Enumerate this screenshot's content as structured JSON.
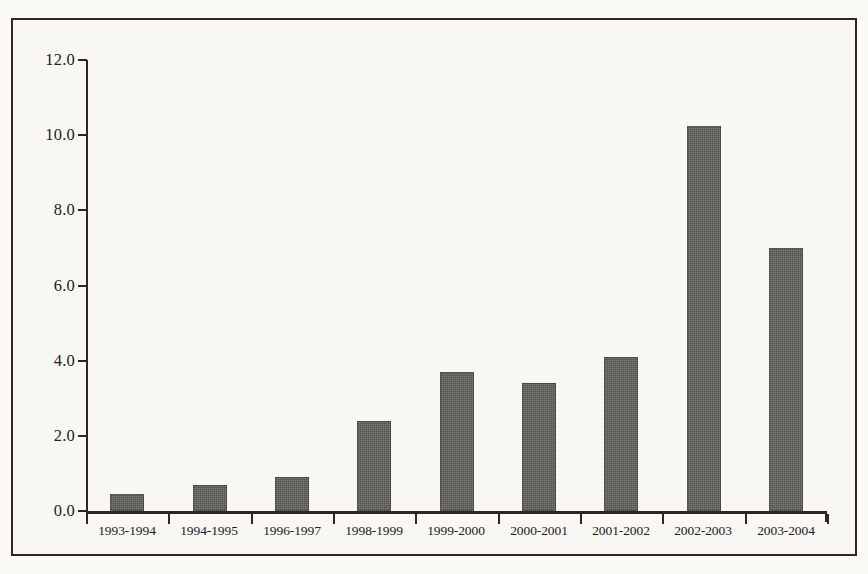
{
  "chart_data": {
    "type": "bar",
    "title": "",
    "subtitle": "",
    "xlabel": "",
    "ylabel": "",
    "categories": [
      "1993-1994",
      "1994-1995",
      "1996-1997",
      "1998-1999",
      "1999-2000",
      "2000-2001",
      "2001-2002",
      "2002-2003",
      "2003-2004"
    ],
    "values": [
      0.45,
      0.7,
      0.9,
      2.4,
      3.7,
      3.4,
      4.1,
      10.25,
      7.0
    ],
    "ylim": [
      0.0,
      12.0
    ],
    "ytick_labels": [
      "0.0",
      "2.0",
      "4.0",
      "6.0",
      "8.0",
      "10.0",
      "12.0"
    ],
    "ytick_values": [
      0.0,
      2.0,
      4.0,
      6.0,
      8.0,
      10.0,
      12.0
    ],
    "grid": false,
    "legend": false,
    "legend_position": "none",
    "bar_color": "#5c5b56",
    "axis_color": "#2b2724",
    "background_color": "#f8f7f4",
    "annotations": []
  }
}
